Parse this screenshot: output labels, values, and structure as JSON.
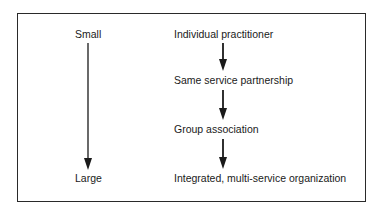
{
  "scale": {
    "top_label": "Small",
    "bottom_label": "Large"
  },
  "stages": [
    "Individual practitioner",
    "Same service partnership",
    "Group association",
    "Integrated, multi-service organization"
  ],
  "colors": {
    "line": "#1a1a1a",
    "border": "#2a2a2a",
    "background": "#ffffff"
  }
}
